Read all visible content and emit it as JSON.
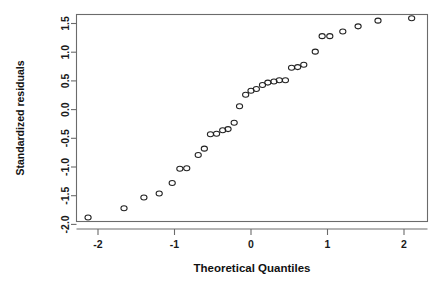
{
  "chart_data": {
    "type": "scatter",
    "title": "",
    "xlabel": "Theoretical Quantiles",
    "ylabel": "Standardized residuals",
    "xlim": [
      -2.35,
      2.3
    ],
    "ylim": [
      -2.1,
      1.72
    ],
    "grid": false,
    "legend": null,
    "xticks": [
      -2,
      -1,
      0,
      1,
      2
    ],
    "xtick_labels": [
      "-2",
      "-1",
      "0",
      "1",
      "2"
    ],
    "yticks": [
      -2.0,
      -1.5,
      -1.0,
      -0.5,
      0.0,
      0.5,
      1.0,
      1.5
    ],
    "ytick_labels": [
      "-2.0",
      "-1.5",
      "-1.0",
      "-0.5",
      "0.0",
      "0.5",
      "1.0",
      "1.5"
    ],
    "marker": "open-circle",
    "marker_color": "#222222",
    "x": [
      -2.13,
      -1.66,
      -1.4,
      -1.2,
      -1.03,
      -0.93,
      -0.84,
      -0.69,
      -0.61,
      -0.53,
      -0.45,
      -0.37,
      -0.3,
      -0.22,
      -0.15,
      -0.07,
      0.0,
      0.07,
      0.15,
      0.22,
      0.3,
      0.37,
      0.45,
      0.53,
      0.61,
      0.69,
      0.84,
      0.93,
      1.03,
      1.2,
      1.4,
      1.66,
      2.1
    ],
    "y": [
      -1.88,
      -1.72,
      -1.53,
      -1.46,
      -1.28,
      -1.03,
      -1.02,
      -0.79,
      -0.68,
      -0.43,
      -0.42,
      -0.36,
      -0.34,
      -0.23,
      0.06,
      0.26,
      0.33,
      0.36,
      0.43,
      0.47,
      0.49,
      0.51,
      0.51,
      0.73,
      0.74,
      0.78,
      1.01,
      1.28,
      1.28,
      1.36,
      1.45,
      1.55,
      1.59
    ],
    "points": [
      {
        "x": -2.13,
        "y": -1.88
      },
      {
        "x": -1.66,
        "y": -1.72
      },
      {
        "x": -1.4,
        "y": -1.53
      },
      {
        "x": -1.2,
        "y": -1.46
      },
      {
        "x": -1.03,
        "y": -1.28
      },
      {
        "x": -0.93,
        "y": -1.03
      },
      {
        "x": -0.84,
        "y": -1.02
      },
      {
        "x": -0.69,
        "y": -0.79
      },
      {
        "x": -0.61,
        "y": -0.68
      },
      {
        "x": -0.53,
        "y": -0.43
      },
      {
        "x": -0.45,
        "y": -0.42
      },
      {
        "x": -0.37,
        "y": -0.36
      },
      {
        "x": -0.3,
        "y": -0.34
      },
      {
        "x": -0.22,
        "y": -0.23
      },
      {
        "x": -0.15,
        "y": 0.06
      },
      {
        "x": -0.07,
        "y": 0.26
      },
      {
        "x": 0.0,
        "y": 0.33
      },
      {
        "x": 0.07,
        "y": 0.36
      },
      {
        "x": 0.15,
        "y": 0.43
      },
      {
        "x": 0.22,
        "y": 0.47
      },
      {
        "x": 0.3,
        "y": 0.49
      },
      {
        "x": 0.37,
        "y": 0.51
      },
      {
        "x": 0.45,
        "y": 0.51
      },
      {
        "x": 0.53,
        "y": 0.73
      },
      {
        "x": 0.61,
        "y": 0.74
      },
      {
        "x": 0.69,
        "y": 0.78
      },
      {
        "x": 0.84,
        "y": 1.01
      },
      {
        "x": 0.93,
        "y": 1.28
      },
      {
        "x": 1.03,
        "y": 1.28
      },
      {
        "x": 1.2,
        "y": 1.36
      },
      {
        "x": 1.4,
        "y": 1.45
      },
      {
        "x": 1.66,
        "y": 1.55
      },
      {
        "x": 2.1,
        "y": 1.59
      }
    ]
  },
  "axes": {
    "x_title": "Theoretical Quantiles",
    "y_title": "Standardized residuals"
  },
  "colors": {
    "axis": "#6b6b6b",
    "text": "#111111",
    "marker": "#222222",
    "background": "#ffffff"
  }
}
